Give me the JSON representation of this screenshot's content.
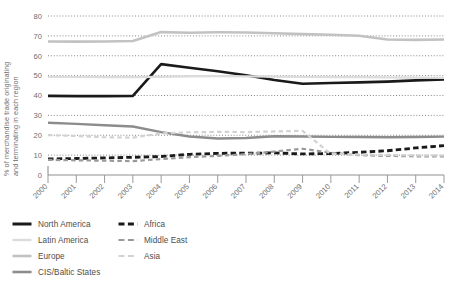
{
  "chart_data": {
    "type": "line",
    "title": "",
    "xlabel": "",
    "ylabel": "% of merchandise trade originating and terminating in each region",
    "ylabel_line1": "% of merchandise trade originating",
    "ylabel_line2": "and terminating in each region",
    "x": [
      "2000",
      "2001",
      "2002",
      "2003",
      "2004",
      "2005",
      "2006",
      "2007",
      "2008",
      "2009",
      "2010",
      "2011",
      "2012",
      "2013",
      "2014"
    ],
    "categories": [
      "2000",
      "2001",
      "2002",
      "2003",
      "2004",
      "2005",
      "2006",
      "2007",
      "2008",
      "2009",
      "2010",
      "2011",
      "2012",
      "2013",
      "2014"
    ],
    "ylim": [
      0,
      80
    ],
    "yticks": [
      0,
      10,
      20,
      30,
      40,
      50,
      60,
      70,
      80
    ],
    "ytick_labels": [
      "0",
      "10",
      "20",
      "30",
      "40",
      "50",
      "60",
      "70",
      "80"
    ],
    "grid": true,
    "grid_style": "dotted-horizontal",
    "legend_position": "below-left",
    "series": [
      {
        "name": "North America",
        "color": "#1a1a1a",
        "style": "solid",
        "width": 2.6,
        "values": [
          39.8,
          39.7,
          39.7,
          39.8,
          55.8,
          54.0,
          52.2,
          50.2,
          47.8,
          45.9,
          46.3,
          46.6,
          47.0,
          47.6,
          48.1
        ]
      },
      {
        "name": "Latin America",
        "color": "#dcdcdc",
        "style": "solid",
        "width": 2.2,
        "values": [
          49.3,
          49.3,
          49.2,
          49.2,
          49.4,
          49.6,
          49.7,
          49.6,
          49.5,
          49.3,
          49.2,
          49.2,
          49.1,
          49.0,
          48.9
        ]
      },
      {
        "name": "Europe",
        "color": "#c2c2c2",
        "style": "solid",
        "width": 2.6,
        "values": [
          67.2,
          67.1,
          67.2,
          67.4,
          71.9,
          71.6,
          71.8,
          71.7,
          71.3,
          70.9,
          70.6,
          70.1,
          68.2,
          68.0,
          68.2
        ]
      },
      {
        "name": "CIS/Baltic States",
        "color": "#8c8c8c",
        "style": "solid",
        "width": 2.4,
        "values": [
          26.3,
          25.7,
          25.0,
          24.4,
          21.6,
          19.4,
          18.4,
          18.6,
          19.5,
          19.4,
          19.2,
          19.1,
          19.0,
          19.1,
          19.3
        ]
      },
      {
        "name": "Africa",
        "color": "#1a1a1a",
        "style": "dashed",
        "width": 2.8,
        "values": [
          8.1,
          8.3,
          8.6,
          8.9,
          9.3,
          10.4,
          10.9,
          11.0,
          11.1,
          10.6,
          10.8,
          11.4,
          12.2,
          13.6,
          14.8
        ]
      },
      {
        "name": "Middle East",
        "color": "#9a9a9a",
        "style": "dashed",
        "width": 2.2,
        "values": [
          7.6,
          7.4,
          7.2,
          7.0,
          8.0,
          9.0,
          9.6,
          10.5,
          11.8,
          13.2,
          11.2,
          10.0,
          9.6,
          9.4,
          9.3
        ]
      },
      {
        "name": "Asia",
        "color": "#d2d2d2",
        "style": "dashed",
        "width": 2.2,
        "values": [
          20.1,
          19.6,
          19.0,
          18.8,
          20.9,
          21.5,
          21.7,
          21.6,
          21.9,
          22.2,
          10.6,
          10.3,
          10.1,
          9.9,
          9.8
        ]
      }
    ],
    "legend": [
      {
        "name": "North America",
        "color": "#1a1a1a",
        "style": "solid",
        "width": 3.0,
        "column": "left"
      },
      {
        "name": "Latin America",
        "color": "#dcdcdc",
        "style": "solid",
        "width": 2.4,
        "column": "left"
      },
      {
        "name": "Europe",
        "color": "#c2c2c2",
        "style": "solid",
        "width": 2.6,
        "column": "left"
      },
      {
        "name": "CIS/Baltic States",
        "color": "#8c8c8c",
        "style": "solid",
        "width": 2.6,
        "column": "left"
      },
      {
        "name": "Africa",
        "color": "#1a1a1a",
        "style": "dashed",
        "width": 3.0,
        "column": "right"
      },
      {
        "name": "Middle East",
        "color": "#9a9a9a",
        "style": "dashed",
        "width": 2.2,
        "column": "right"
      },
      {
        "name": "Asia",
        "color": "#d2d2d2",
        "style": "dashed",
        "width": 2.2,
        "column": "right"
      }
    ],
    "colors": {
      "axis": "#8f8f8f",
      "grid": "#7a7a7a",
      "tick_text": "#6e6e6e",
      "legend_text": "#4d4d4d",
      "background": "#ffffff"
    }
  }
}
